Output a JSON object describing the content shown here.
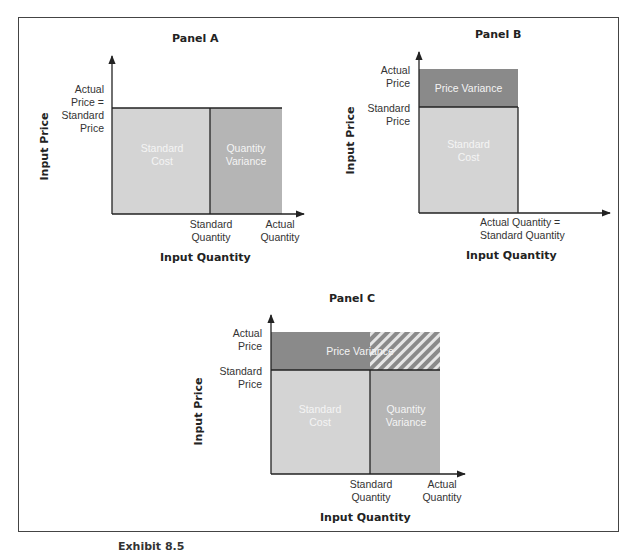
{
  "panels": {
    "a": {
      "title": "Panel A",
      "ylabel": "Input Price",
      "xlabel": "Input Quantity",
      "y_tick_line1": "Actual",
      "y_tick_line2": "Price =",
      "y_tick_line3": "Standard",
      "y_tick_line4": "Price",
      "x_tick1_line1": "Standard",
      "x_tick1_line2": "Quantity",
      "x_tick2_line1": "Actual",
      "x_tick2_line2": "Quantity",
      "region1_line1": "Standard",
      "region1_line2": "Cost",
      "region2_line1": "Quantity",
      "region2_line2": "Variance"
    },
    "b": {
      "title": "Panel B",
      "ylabel": "Input Price",
      "xlabel": "Input Quantity",
      "y_tick1_line1": "Actual",
      "y_tick1_line2": "Price",
      "y_tick2_line1": "Standard",
      "y_tick2_line2": "Price",
      "x_tick_line1": "Actual Quantity =",
      "x_tick_line2": "Standard Quantity",
      "region_top": "Price Variance",
      "region_bottom_line1": "Standard",
      "region_bottom_line2": "Cost"
    },
    "c": {
      "title": "Panel C",
      "ylabel": "Input Price",
      "xlabel": "Input Quantity",
      "y_tick1_line1": "Actual",
      "y_tick1_line2": "Price",
      "y_tick2_line1": "Standard",
      "y_tick2_line2": "Price",
      "x_tick1_line1": "Standard",
      "x_tick1_line2": "Quantity",
      "x_tick2_line1": "Actual",
      "x_tick2_line2": "Quantity",
      "region_top": "Price Variance",
      "region1_line1": "Standard",
      "region1_line2": "Cost",
      "region2_line1": "Quantity",
      "region2_line2": "Variance"
    }
  },
  "caption": "Exhibit 8.5",
  "colors": {
    "standard_cost": "#d4d4d4",
    "quantity_variance": "#b5b5b5",
    "price_variance": "#8a8a8a",
    "hatch_stripe": "#ffffff",
    "axis": "#222222"
  }
}
